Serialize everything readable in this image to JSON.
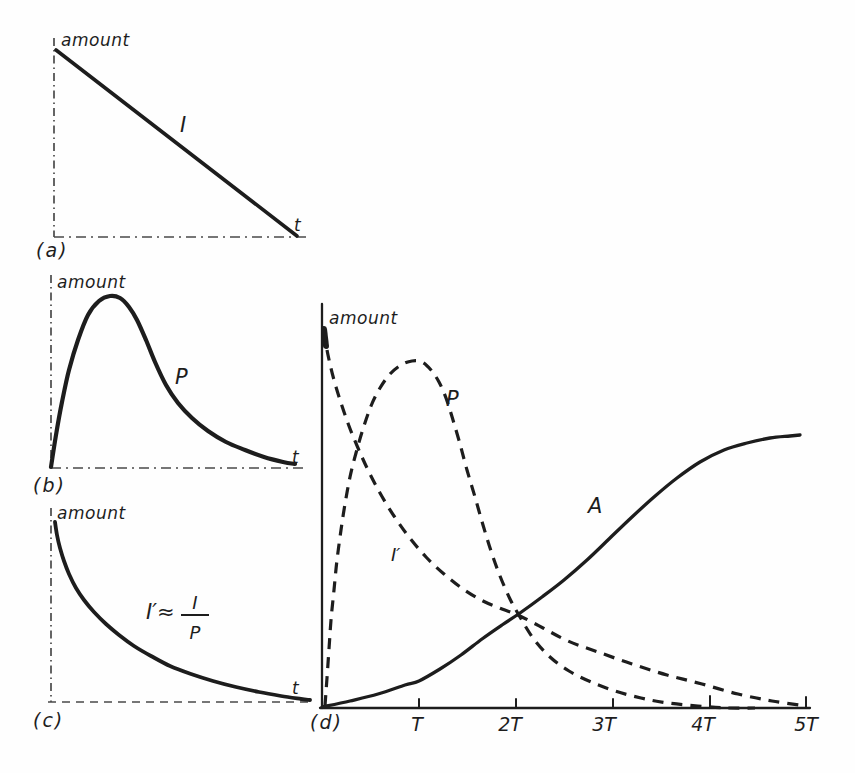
{
  "style": {
    "ink": "#1d1d1d",
    "axis_gray": "#4a4a4a",
    "paper": "#fefefe"
  },
  "chart_data": [
    {
      "id": "a",
      "type": "line",
      "title": "",
      "ylabel": "amount",
      "xlabel": "t",
      "caption": "(a)",
      "labels": {
        "line": "I"
      },
      "description": "Amount of I decreases linearly with time t from maximum to zero",
      "axes": [
        {
          "name": "y-axis",
          "width": 1.7,
          "dash": "8 4 1.5 4",
          "smooth": false,
          "points": [
            [
              54,
              38
            ],
            [
              54,
              237
            ]
          ]
        },
        {
          "name": "x-axis",
          "width": 1.7,
          "dash": "10 5 2 5",
          "smooth": false,
          "points": [
            [
              54,
              237
            ],
            [
              308,
              237
            ]
          ]
        }
      ],
      "series": [
        {
          "name": "curve-I",
          "width": 3.6,
          "smooth": false,
          "points": [
            [
              56,
              50
            ],
            [
              297,
              236
            ]
          ]
        }
      ]
    },
    {
      "id": "b",
      "type": "line",
      "title": "",
      "ylabel": "amount",
      "xlabel": "t",
      "caption": "(b)",
      "labels": {
        "curve": "P"
      },
      "description": "Amount of P rises quickly to a maximum then decays toward zero",
      "axes": [
        {
          "name": "y-axis",
          "width": 1.7,
          "dash": "8 4 1.5 4",
          "smooth": false,
          "points": [
            [
              51,
              275
            ],
            [
              51,
              468
            ]
          ]
        },
        {
          "name": "x-axis",
          "width": 1.7,
          "dash": "10 5 2 5",
          "smooth": false,
          "points": [
            [
              51,
              468
            ],
            [
              306,
              468
            ]
          ]
        }
      ],
      "series": [
        {
          "name": "curve-P",
          "width": 4.2,
          "smooth": true,
          "points": [
            [
              51,
              467
            ],
            [
              56,
              435
            ],
            [
              62,
              402
            ],
            [
              69,
              370
            ],
            [
              78,
              340
            ],
            [
              88,
              315
            ],
            [
              99,
              301
            ],
            [
              110,
              296
            ],
            [
              120,
              298
            ],
            [
              129,
              307
            ],
            [
              137,
              320
            ],
            [
              146,
              340
            ],
            [
              155,
              362
            ],
            [
              166,
              385
            ],
            [
              178,
              403
            ],
            [
              192,
              418
            ],
            [
              208,
              431
            ],
            [
              226,
              442
            ],
            [
              245,
              450
            ],
            [
              264,
              457
            ],
            [
              283,
              462
            ],
            [
              295,
              464
            ]
          ]
        }
      ]
    },
    {
      "id": "c",
      "type": "line",
      "title": "",
      "ylabel": "amount",
      "xlabel": "t",
      "caption": "(c)",
      "labels": {
        "expr_prefix": "I′≈",
        "frac_num": "I",
        "frac_den": "P"
      },
      "description": "Ratio I′ ≈ I/P decays smoothly toward zero with time t",
      "axes": [
        {
          "name": "y-axis",
          "width": 1.7,
          "dash": "8 4 1.5 4",
          "smooth": false,
          "points": [
            [
              51,
              508
            ],
            [
              51,
              702
            ]
          ]
        },
        {
          "name": "x-axis",
          "width": 1.7,
          "dash": "8 6",
          "smooth": false,
          "points": [
            [
              48,
              702
            ],
            [
              310,
              702
            ]
          ]
        }
      ],
      "series": [
        {
          "name": "curve-I-prime",
          "width": 3.8,
          "smooth": true,
          "points": [
            [
              55,
              522
            ],
            [
              57,
              535
            ],
            [
              60,
              548
            ],
            [
              64,
              561
            ],
            [
              69,
              574
            ],
            [
              76,
              588
            ],
            [
              84,
              600
            ],
            [
              94,
              612
            ],
            [
              106,
              624
            ],
            [
              119,
              635
            ],
            [
              134,
              646
            ],
            [
              151,
              656
            ],
            [
              170,
              666
            ],
            [
              191,
              674
            ],
            [
              213,
              681
            ],
            [
              236,
              687
            ],
            [
              259,
              692
            ],
            [
              281,
              696
            ],
            [
              301,
              699
            ],
            [
              310,
              700
            ]
          ]
        }
      ]
    },
    {
      "id": "d",
      "type": "line",
      "title": "",
      "ylabel": "amount",
      "xlabel": "",
      "caption": "(d)",
      "labels": {
        "iprime": "I′",
        "p": "P",
        "a": "A"
      },
      "xticks": [
        "T",
        "2T",
        "3T",
        "4T",
        "5T"
      ],
      "description": "Parent I′ (dashed) decays from maximum; daughter P (dashed) grows, peaks near T, then decays; stable product A (solid) grows sigmoidally toward saturation; time axis in half-lives T to 5T",
      "axes": [
        {
          "name": "y-axis",
          "width": 2.3,
          "smooth": false,
          "points": [
            [
              322,
              304
            ],
            [
              322,
              708
            ]
          ]
        },
        {
          "name": "x-axis",
          "width": 2.3,
          "smooth": false,
          "points": [
            [
              320,
              708
            ],
            [
              810,
              708
            ]
          ]
        }
      ],
      "ticks": [
        {
          "name": "tick-T",
          "width": 2,
          "smooth": false,
          "points": [
            [
              419,
              699
            ],
            [
              419,
              708
            ]
          ]
        },
        {
          "name": "tick-2T",
          "width": 2,
          "smooth": false,
          "points": [
            [
              516,
              699
            ],
            [
              516,
              708
            ]
          ]
        },
        {
          "name": "tick-3T",
          "width": 2,
          "smooth": false,
          "points": [
            [
              613,
              699
            ],
            [
              613,
              708
            ]
          ]
        },
        {
          "name": "tick-4T",
          "width": 2,
          "smooth": false,
          "points": [
            [
              710,
              696
            ],
            [
              710,
              708
            ]
          ]
        },
        {
          "name": "tick-5T",
          "width": 2,
          "smooth": false,
          "points": [
            [
              806,
              697
            ],
            [
              806,
              708
            ]
          ]
        }
      ],
      "series": [
        {
          "name": "curve-I-prime-start",
          "width": 6,
          "smooth": false,
          "points": [
            [
              324,
              329
            ],
            [
              326,
              346
            ]
          ]
        },
        {
          "name": "curve-I-prime",
          "width": 3.2,
          "dash": "11 8",
          "smooth": true,
          "points": [
            [
              324,
              331
            ],
            [
              328,
              355
            ],
            [
              334,
              380
            ],
            [
              341,
              403
            ],
            [
              349,
              426
            ],
            [
              358,
              448
            ],
            [
              368,
              470
            ],
            [
              380,
              493
            ],
            [
              394,
              516
            ],
            [
              409,
              537
            ],
            [
              426,
              557
            ],
            [
              444,
              574
            ],
            [
              463,
              589
            ],
            [
              483,
              601
            ],
            [
              502,
              609
            ],
            [
              520,
              616
            ],
            [
              543,
              628
            ],
            [
              568,
              641
            ],
            [
              598,
              652
            ],
            [
              632,
              664
            ],
            [
              667,
              675
            ],
            [
              702,
              684
            ],
            [
              738,
              694
            ],
            [
              772,
              701
            ],
            [
              806,
              706
            ]
          ]
        },
        {
          "name": "curve-P",
          "width": 3.2,
          "dash": "11 8",
          "smooth": true,
          "points": [
            [
              325,
              706
            ],
            [
              327,
              678
            ],
            [
              329,
              649
            ],
            [
              331,
              620
            ],
            [
              334,
              590
            ],
            [
              337,
              560
            ],
            [
              341,
              530
            ],
            [
              345,
              504
            ],
            [
              350,
              477
            ],
            [
              356,
              453
            ],
            [
              363,
              429
            ],
            [
              371,
              406
            ],
            [
              380,
              388
            ],
            [
              390,
              374
            ],
            [
              401,
              365
            ],
            [
              412,
              361
            ],
            [
              422,
              362
            ],
            [
              431,
              370
            ],
            [
              439,
              382
            ],
            [
              446,
              398
            ],
            [
              453,
              420
            ],
            [
              460,
              444
            ],
            [
              467,
              470
            ],
            [
              475,
              497
            ],
            [
              483,
              525
            ],
            [
              491,
              551
            ],
            [
              500,
              576
            ],
            [
              510,
              599
            ],
            [
              520,
              617
            ],
            [
              533,
              638
            ],
            [
              550,
              657
            ],
            [
              569,
              671
            ],
            [
              591,
              682
            ],
            [
              615,
              691
            ],
            [
              641,
              698
            ],
            [
              668,
              703
            ],
            [
              698,
              706
            ],
            [
              728,
              708
            ],
            [
              755,
              708
            ]
          ]
        },
        {
          "name": "curve-A",
          "width": 3.3,
          "smooth": true,
          "points": [
            [
              322,
              707
            ],
            [
              350,
              701
            ],
            [
              378,
              694
            ],
            [
              405,
              685
            ],
            [
              419,
              681
            ],
            [
              440,
              669
            ],
            [
              461,
              655
            ],
            [
              482,
              639
            ],
            [
              502,
              625
            ],
            [
              520,
              613
            ],
            [
              542,
              597
            ],
            [
              564,
              580
            ],
            [
              587,
              560
            ],
            [
              610,
              538
            ],
            [
              632,
              517
            ],
            [
              654,
              497
            ],
            [
              677,
              478
            ],
            [
              700,
              462
            ],
            [
              724,
              450
            ],
            [
              747,
              443
            ],
            [
              770,
              438
            ],
            [
              790,
              436
            ],
            [
              800,
              435
            ]
          ]
        }
      ]
    }
  ]
}
